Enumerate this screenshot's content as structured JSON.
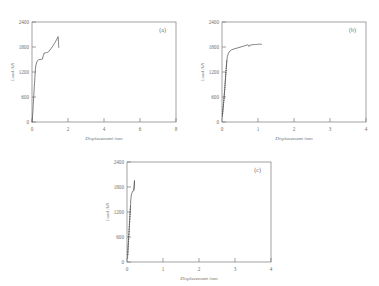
{
  "figure": {
    "background_color": "#ffffff",
    "axis_color": "#7a7a7a",
    "curve_color": "#4a4a4a",
    "text_color": "#6e6e6e"
  },
  "chart_data": [
    {
      "type": "line",
      "panel_label": "(a)",
      "title": "",
      "xlabel": "Displacement /mm",
      "ylabel": "Load /kN",
      "xlim": [
        0,
        8
      ],
      "ylim": [
        0,
        2400
      ],
      "xticks": [
        0,
        2,
        4,
        6,
        8
      ],
      "xticklabels": [
        "0",
        "2",
        "4",
        "6",
        "8"
      ],
      "yticks": [
        0,
        600,
        1200,
        1800,
        2400
      ],
      "yticklabels": [
        "0",
        "600",
        "1200",
        "1800",
        "2400"
      ],
      "grid": false,
      "legend": "none",
      "series": [
        {
          "name": "load-displacement",
          "x": [
            0.0,
            0.02,
            0.03,
            0.05,
            0.06,
            0.07,
            0.08,
            0.09,
            0.1,
            0.11,
            0.12,
            0.13,
            0.14,
            0.15,
            0.16,
            0.17,
            0.18,
            0.19,
            0.2,
            0.23,
            0.27,
            0.31,
            0.35,
            0.4,
            0.46,
            0.52,
            0.58,
            0.63,
            0.68,
            0.72,
            0.76,
            0.8,
            0.83,
            0.86,
            0.9,
            0.95,
            1.0,
            1.06,
            1.12,
            1.18,
            1.24,
            1.3,
            1.36,
            1.42,
            1.45,
            1.46,
            1.47,
            1.48,
            1.49
          ],
          "y": [
            0,
            60,
            150,
            250,
            340,
            420,
            500,
            575,
            650,
            720,
            790,
            860,
            930,
            1000,
            1070,
            1140,
            1205,
            1265,
            1320,
            1385,
            1440,
            1475,
            1490,
            1495,
            1500,
            1505,
            1510,
            1600,
            1655,
            1660,
            1662,
            1665,
            1668,
            1670,
            1675,
            1700,
            1730,
            1765,
            1800,
            1840,
            1880,
            1925,
            1970,
            2020,
            2050,
            1990,
            1910,
            1840,
            1790
          ]
        }
      ]
    },
    {
      "type": "line",
      "panel_label": "(b)",
      "title": "",
      "xlabel": "Displacement /mm",
      "ylabel": "Load /kN",
      "xlim": [
        0,
        4
      ],
      "ylim": [
        0,
        2400
      ],
      "xticks": [
        0,
        1,
        2,
        3,
        4
      ],
      "xticklabels": [
        "0",
        "1",
        "2",
        "3",
        "4"
      ],
      "yticks": [
        0,
        600,
        1200,
        1800,
        2400
      ],
      "yticklabels": [
        "0",
        "600",
        "1200",
        "1800",
        "2400"
      ],
      "grid": false,
      "legend": "none",
      "series": [
        {
          "name": "load-displacement",
          "x": [
            0.01,
            0.012,
            0.018,
            0.015,
            0.022,
            0.019,
            0.028,
            0.024,
            0.033,
            0.029,
            0.038,
            0.034,
            0.043,
            0.039,
            0.048,
            0.044,
            0.053,
            0.049,
            0.058,
            0.054,
            0.062,
            0.057,
            0.066,
            0.06,
            0.07,
            0.064,
            0.074,
            0.068,
            0.078,
            0.072,
            0.082,
            0.076,
            0.086,
            0.08,
            0.09,
            0.084,
            0.094,
            0.088,
            0.098,
            0.092,
            0.1,
            0.095,
            0.104,
            0.098,
            0.108,
            0.102,
            0.112,
            0.106,
            0.116,
            0.11,
            0.12,
            0.115,
            0.125,
            0.118,
            0.128,
            0.122,
            0.132,
            0.126,
            0.136,
            0.13,
            0.14,
            0.15,
            0.175,
            0.215,
            0.27,
            0.34,
            0.42,
            0.5,
            0.565,
            0.62,
            0.665,
            0.7,
            0.72,
            0.735,
            0.745,
            0.75,
            0.76,
            0.775,
            0.8,
            0.83,
            0.865,
            0.9,
            0.935,
            0.965,
            0.99,
            1.01,
            1.03,
            1.05,
            1.065,
            1.08,
            1.09,
            1.1
          ],
          "y": [
            120,
            170,
            215,
            190,
            255,
            235,
            300,
            280,
            345,
            325,
            390,
            370,
            435,
            415,
            480,
            460,
            525,
            505,
            570,
            550,
            615,
            595,
            660,
            640,
            705,
            685,
            750,
            730,
            795,
            775,
            840,
            820,
            885,
            865,
            930,
            910,
            975,
            955,
            1020,
            1000,
            1065,
            1045,
            1110,
            1090,
            1155,
            1135,
            1200,
            1180,
            1245,
            1225,
            1290,
            1275,
            1335,
            1315,
            1380,
            1360,
            1425,
            1405,
            1470,
            1450,
            1515,
            1570,
            1640,
            1700,
            1735,
            1755,
            1775,
            1795,
            1812,
            1826,
            1838,
            1848,
            1856,
            1845,
            1828,
            1812,
            1826,
            1840,
            1848,
            1852,
            1856,
            1858,
            1860,
            1862,
            1864,
            1866,
            1866,
            1868,
            1868,
            1868,
            1866,
            1862
          ]
        }
      ]
    },
    {
      "type": "line",
      "panel_label": "(c)",
      "title": "",
      "xlabel": "Displacement /mm",
      "ylabel": "Load /kN",
      "xlim": [
        0,
        4
      ],
      "ylim": [
        0,
        2400
      ],
      "xticks": [
        0,
        1,
        2,
        3,
        4
      ],
      "xticklabels": [
        "0",
        "1",
        "2",
        "3",
        "4"
      ],
      "yticks": [
        0,
        600,
        1200,
        1800,
        2400
      ],
      "yticklabels": [
        "0",
        "600",
        "1200",
        "1800",
        "2400"
      ],
      "grid": false,
      "legend": "none",
      "series": [
        {
          "name": "load-displacement",
          "x": [
            0.015,
            0.018,
            0.022,
            0.02,
            0.026,
            0.023,
            0.03,
            0.027,
            0.034,
            0.031,
            0.038,
            0.035,
            0.042,
            0.039,
            0.046,
            0.043,
            0.05,
            0.047,
            0.054,
            0.051,
            0.058,
            0.055,
            0.062,
            0.059,
            0.066,
            0.063,
            0.07,
            0.067,
            0.074,
            0.071,
            0.078,
            0.075,
            0.082,
            0.079,
            0.086,
            0.083,
            0.09,
            0.087,
            0.094,
            0.091,
            0.098,
            0.095,
            0.102,
            0.1,
            0.108,
            0.12,
            0.14,
            0.16,
            0.175,
            0.185,
            0.192,
            0.198,
            0.202,
            0.206,
            0.208,
            0.205,
            0.2,
            0.196,
            0.192
          ],
          "y": [
            90,
            145,
            200,
            175,
            260,
            235,
            320,
            295,
            380,
            355,
            440,
            415,
            500,
            475,
            560,
            535,
            620,
            595,
            680,
            655,
            740,
            715,
            800,
            775,
            860,
            835,
            920,
            895,
            980,
            955,
            1040,
            1015,
            1100,
            1075,
            1160,
            1135,
            1220,
            1195,
            1280,
            1255,
            1340,
            1315,
            1400,
            1440,
            1520,
            1600,
            1665,
            1700,
            1712,
            1700,
            1740,
            1800,
            1860,
            1915,
            1955,
            1900,
            1830,
            1780,
            1740
          ]
        }
      ]
    }
  ]
}
